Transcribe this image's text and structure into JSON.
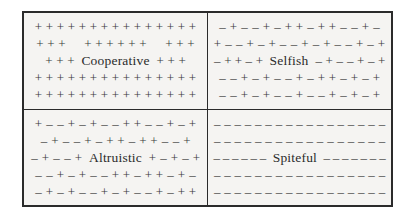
{
  "figure": {
    "border_color": "#2b2b2b",
    "background_color": "#f5f4f2",
    "symbol_color": "#3a3a3a",
    "plus": "+",
    "minus": "–"
  },
  "quadrants": [
    {
      "key": "cooperative",
      "label": "Cooperative",
      "position": "top-left",
      "label_row_index": 2,
      "rows": [
        [
          "+",
          "+",
          "+",
          "+",
          "+",
          "+",
          "+",
          "+",
          "+",
          "+",
          "+",
          "+",
          "+",
          "+",
          "+"
        ],
        [
          "+",
          "+",
          "+",
          "",
          "+",
          "+",
          "+",
          "+",
          "+",
          "+",
          "",
          "+",
          "+",
          "+"
        ],
        [
          "+",
          "+",
          "+"
        ],
        [
          "+",
          "+",
          "+",
          "+",
          "+",
          "+",
          "+",
          "+",
          "+",
          "+",
          "+",
          "+",
          "+",
          "+",
          "+"
        ],
        [
          "+",
          "+",
          "+",
          "+",
          "+",
          "+",
          "+",
          "+",
          "+",
          "+",
          "+",
          "+",
          "+",
          "+",
          "+"
        ]
      ],
      "label_row_left": [
        "+",
        "+",
        "+"
      ],
      "label_row_right": [
        "+",
        "+",
        "+"
      ]
    },
    {
      "key": "selfish",
      "label": "Selfish",
      "position": "top-right",
      "label_row_index": 2,
      "rows": [
        [
          "–",
          "+",
          "–",
          "–",
          "+",
          "–",
          "+",
          "+",
          "–",
          "+",
          "+",
          "–",
          "–",
          "+",
          "–"
        ],
        [
          "+",
          "–",
          "–",
          "+",
          "–",
          "+",
          "–",
          "–",
          "+",
          "–",
          "+",
          "–",
          "–",
          "+",
          "–",
          "+"
        ],
        [],
        [
          "–",
          "–",
          "+",
          "–",
          "+",
          "–",
          "–",
          "+",
          "–",
          "+",
          "+",
          "–",
          "+",
          "–",
          "+"
        ],
        [
          "–",
          "–",
          "+",
          "–",
          "+",
          "–",
          "–",
          "+",
          "–",
          "–",
          "+",
          "–",
          "+",
          "–",
          "+"
        ]
      ],
      "label_row_left": [
        "–",
        "+",
        "+",
        "–",
        "+"
      ],
      "label_row_right": [
        "–",
        "+",
        "–",
        "–",
        "+",
        "–",
        "+"
      ]
    },
    {
      "key": "altruistic",
      "label": "Altruistic",
      "position": "bottom-left",
      "label_row_index": 2,
      "rows": [
        [
          "+",
          "–",
          "–",
          "+",
          "–",
          "+",
          "–",
          "–",
          "+",
          "+",
          "–",
          "–",
          "+",
          "–",
          "+"
        ],
        [
          "–",
          "+",
          "–",
          "–",
          "+",
          "–",
          "+",
          "+",
          "–",
          "+",
          "+",
          "–",
          "–",
          "+"
        ],
        [],
        [
          "–",
          "–",
          "+",
          "–",
          "+",
          "–",
          "–",
          "+",
          "+",
          "–",
          "+",
          "+",
          "–",
          "+",
          "–"
        ],
        [
          "–",
          "+",
          "–",
          "+",
          "–",
          "–",
          "+",
          "–",
          "+",
          "–",
          "–",
          "+",
          "–",
          "+",
          "+"
        ]
      ],
      "label_row_left": [
        "–",
        "+",
        "–",
        "–",
        "+"
      ],
      "label_row_right": [
        "+",
        "–",
        "+",
        "–",
        "+"
      ]
    },
    {
      "key": "spiteful",
      "label": "Spiteful",
      "position": "bottom-right",
      "label_row_index": 2,
      "rows": [
        [
          "–",
          "–",
          "–",
          "–",
          "–",
          "–",
          "–",
          "–",
          "–",
          "–",
          "–",
          "–",
          "–",
          "–",
          "–",
          "–",
          "–"
        ],
        [
          "–",
          "–",
          "–",
          "–",
          "–",
          "–",
          "–",
          "–",
          "–",
          "–",
          "–",
          "–",
          "–",
          "–",
          "–",
          "–",
          "–"
        ],
        [],
        [
          "–",
          "–",
          "–",
          "–",
          "–",
          "–",
          "–",
          "–",
          "–",
          "–",
          "–",
          "–",
          "–",
          "–",
          "–",
          "–",
          "–"
        ],
        [
          "–",
          "–",
          "–",
          "–",
          "–",
          "–",
          "–",
          "–",
          "–",
          "–",
          "–",
          "–",
          "–",
          "–",
          "–",
          "–",
          "–"
        ]
      ],
      "label_row_left": [
        "–",
        "–",
        "–",
        "–",
        "–",
        "–"
      ],
      "label_row_right": [
        "–",
        "–",
        "–",
        "–",
        "–",
        "–",
        "–"
      ]
    }
  ]
}
